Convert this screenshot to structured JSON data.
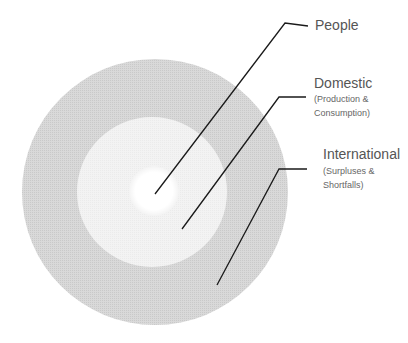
{
  "diagram": {
    "type": "concentric-circles",
    "colors": {
      "outer_ring": "#d4d4d4",
      "middle_ring": "#f0f0f0",
      "center": "#ffffff",
      "leader_line": "#1a1a1a",
      "label_text": "#555555"
    },
    "layers": [
      {
        "id": "people",
        "title": "People",
        "subtitle_lines": []
      },
      {
        "id": "domestic",
        "title": "Domestic",
        "subtitle_lines": [
          "(Production &",
          "Consumption)"
        ]
      },
      {
        "id": "international",
        "title": "International",
        "subtitle_lines": [
          "(Surpluses &",
          "Shortfalls)"
        ]
      }
    ]
  }
}
